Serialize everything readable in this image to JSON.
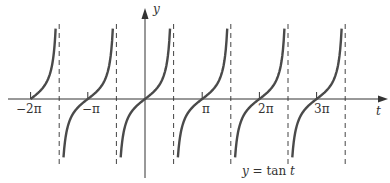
{
  "chart_data": {
    "type": "line",
    "title": "y = tan t",
    "caption": "y = tan t",
    "xlabel": "t",
    "ylabel": "y",
    "function": "tan",
    "x_range": [
      -7.0,
      12.5
    ],
    "y_range": [
      -5.5,
      5.5
    ],
    "x_ticks": [
      {
        "value": -6.2832,
        "label": "−2π"
      },
      {
        "value": -3.1416,
        "label": "−π"
      },
      {
        "value": 3.1416,
        "label": "π"
      },
      {
        "value": 6.2832,
        "label": "2π"
      },
      {
        "value": 9.4248,
        "label": "3π"
      }
    ],
    "asymptotes": [
      -4.7124,
      -1.5708,
      1.5708,
      4.7124,
      7.854,
      10.9956
    ],
    "asymptote_style": "dashed",
    "branches": [
      {
        "from": -6.2832,
        "to": -4.7124
      },
      {
        "from": -4.7124,
        "to": -1.5708
      },
      {
        "from": -1.5708,
        "to": 1.5708
      },
      {
        "from": 1.5708,
        "to": 4.7124
      },
      {
        "from": 4.7124,
        "to": 7.854
      },
      {
        "from": 7.854,
        "to": 10.9956
      }
    ],
    "grid": false,
    "legend": null
  },
  "labels": {
    "y_axis": "y",
    "t_axis": "t",
    "caption": "y = tan t",
    "ticks": [
      "−2π",
      "−π",
      "π",
      "2π",
      "3π"
    ]
  },
  "colors": {
    "curve": "#4a4a4a",
    "axis": "#333333",
    "asymptote": "#444444"
  }
}
